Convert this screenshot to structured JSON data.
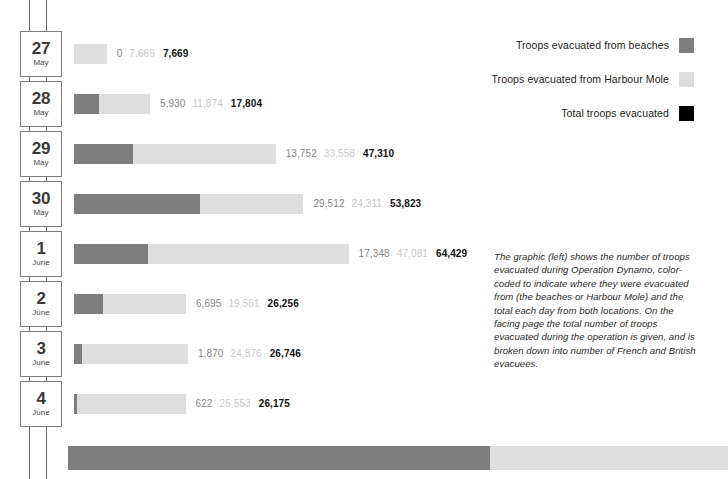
{
  "chart_data": {
    "type": "bar",
    "title": "Troops evacuated during Operation Dynamo",
    "xlabel": "",
    "ylabel": "",
    "stacked": true,
    "orientation": "horizontal",
    "grid": false,
    "legend_position": "top-right",
    "xlim": [
      0,
      64429
    ],
    "categories": [
      "27 May",
      "28 May",
      "29 May",
      "30 May",
      "1 June",
      "2 June",
      "3 June",
      "4 June"
    ],
    "series": [
      {
        "name": "Troops evacuated from beaches",
        "color": "#7d7d7d",
        "values": [
          0,
          5930,
          13752,
          29512,
          17348,
          6695,
          1870,
          622
        ]
      },
      {
        "name": "Troops evacuated from Harbour Mole",
        "color": "#dedede",
        "values": [
          7669,
          11874,
          33558,
          24311,
          47081,
          19561,
          24876,
          25553
        ]
      },
      {
        "name": "Total troops evacuated",
        "color": "#000000",
        "values": [
          7669,
          17804,
          47310,
          53823,
          64429,
          26256,
          26746,
          26175
        ]
      }
    ]
  },
  "rows": [
    {
      "day": "27",
      "month": "May",
      "beaches": "0",
      "mole": "7,669",
      "total": "7,669",
      "beaches_val": 0,
      "mole_val": 7669
    },
    {
      "day": "28",
      "month": "May",
      "beaches": "5,930",
      "mole": "11,874",
      "total": "17,804",
      "beaches_val": 5930,
      "mole_val": 11874
    },
    {
      "day": "29",
      "month": "May",
      "beaches": "13,752",
      "mole": "33,558",
      "total": "47,310",
      "beaches_val": 13752,
      "mole_val": 33558
    },
    {
      "day": "30",
      "month": "May",
      "beaches": "29,512",
      "mole": "24,311",
      "total": "53,823",
      "beaches_val": 29512,
      "mole_val": 24311
    },
    {
      "day": "1",
      "month": "June",
      "beaches": "17,348",
      "mole": "47,081",
      "total": "64,429",
      "beaches_val": 17348,
      "mole_val": 47081
    },
    {
      "day": "2",
      "month": "June",
      "beaches": "6,695",
      "mole": "19,561",
      "total": "26,256",
      "beaches_val": 6695,
      "mole_val": 19561
    },
    {
      "day": "3",
      "month": "June",
      "beaches": "1,870",
      "mole": "24,876",
      "total": "26,746",
      "beaches_val": 1870,
      "mole_val": 24876
    },
    {
      "day": "4",
      "month": "June",
      "beaches": "622",
      "mole": "25,553",
      "total": "26,175",
      "beaches_val": 622,
      "mole_val": 25553
    }
  ],
  "legend": {
    "items": [
      {
        "label": "Troops evacuated from beaches",
        "color": "#7d7d7d"
      },
      {
        "label": "Troops evacuated from Harbour Mole",
        "color": "#dedede"
      },
      {
        "label": "Total troops evacuated",
        "color": "#000000"
      }
    ]
  },
  "caption": {
    "text": "The graphic (left) shows the number of troops evacuated during Operation Dynamo, color-coded to indicate where they were evacuated from (the beaches or Harbour Mole) and the total each day from both locations. On the facing page the total number of troops evacuated during the operation is given, and is broken down into number of French and British evacuees."
  },
  "summary_bar": {
    "dark_width": 422,
    "colors": {
      "dark": "#7d7d7d",
      "light": "#dedede"
    }
  },
  "colors": {
    "beaches": "#7d7d7d",
    "mole": "#dedede",
    "total": "#000000",
    "rail": "#6d6d6d",
    "box_border": "#7c7c7c"
  }
}
